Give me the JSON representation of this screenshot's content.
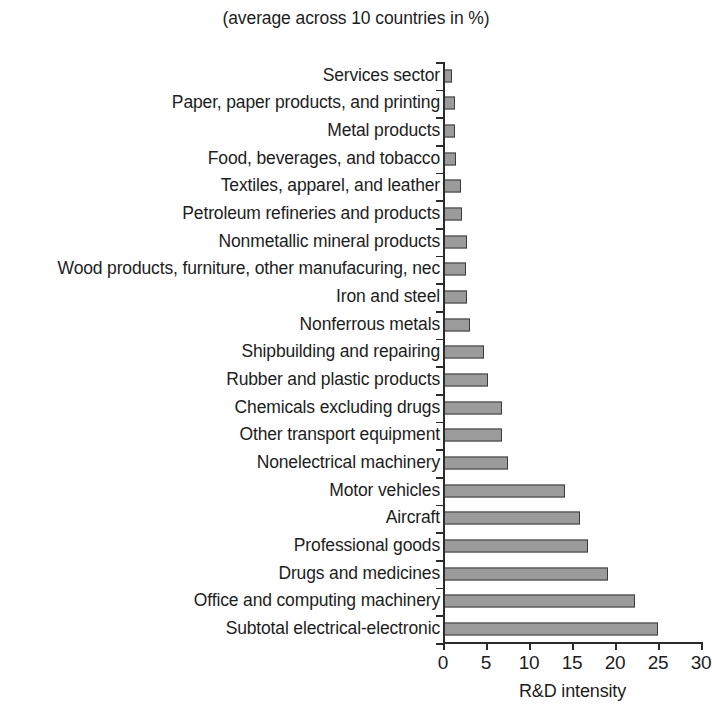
{
  "chart_data": {
    "type": "bar",
    "orientation": "horizontal",
    "title": "(average across 10 countries in %)",
    "xlabel": "R&D intensity",
    "ylabel": "",
    "xlim": [
      0,
      30
    ],
    "xticks": [
      0,
      5,
      10,
      15,
      20,
      25,
      30
    ],
    "grid": false,
    "legend": null,
    "bar_color": "#9b9b9b",
    "bar_edge_color": "#3a3a3a",
    "axis_color": "#2b2b2b",
    "categories": [
      "Services sector",
      "Paper, paper products, and printing",
      "Metal products",
      "Food, beverages, and tobacco",
      "Textiles, apparel, and leather",
      "Petroleum refineries and products",
      "Nonmetallic mineral products",
      "Wood products, furniture, other manufacuring, nec",
      "Iron and steel",
      "Nonferrous metals",
      "Shipbuilding and repairing",
      "Rubber and plastic products",
      "Chemicals excluding drugs",
      "Other transport equipment",
      "Nonelectrical machinery",
      "Motor vehicles",
      "Aircraft",
      "Professional goods",
      "Drugs and medicines",
      "Office and computing machinery",
      "Subtotal electrical-electronic"
    ],
    "values": [
      1.0,
      1.4,
      1.4,
      1.5,
      2.1,
      2.2,
      2.8,
      2.7,
      2.8,
      3.1,
      4.8,
      5.2,
      6.9,
      6.9,
      7.6,
      14.2,
      15.9,
      16.9,
      19.2,
      22.3,
      25.0
    ]
  }
}
